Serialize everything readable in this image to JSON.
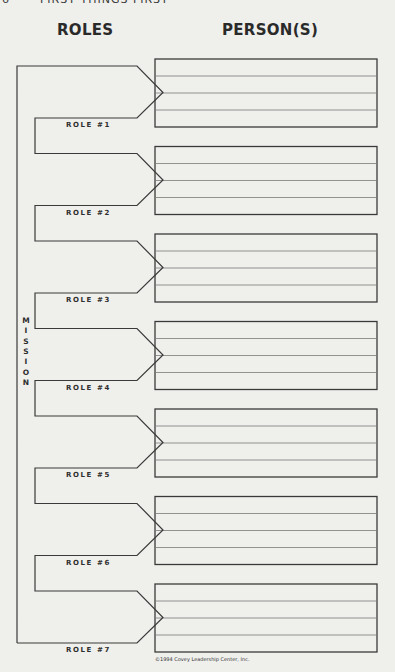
{
  "header": {
    "page_number": "6",
    "book_title": "FIRST THINGS FIRST"
  },
  "headings": {
    "roles": "ROLES",
    "persons": "PERSON(S)"
  },
  "mission": {
    "label": "MISSION",
    "letters": [
      "M",
      "I",
      "S",
      "S",
      "I",
      "O",
      "N"
    ]
  },
  "roles": [
    {
      "label": "ROLE #1",
      "persons": [
        "",
        "",
        "",
        ""
      ]
    },
    {
      "label": "ROLE #2",
      "persons": [
        "",
        "",
        "",
        ""
      ]
    },
    {
      "label": "ROLE #3",
      "persons": [
        "",
        "",
        "",
        ""
      ]
    },
    {
      "label": "ROLE #4",
      "persons": [
        "",
        "",
        "",
        ""
      ]
    },
    {
      "label": "ROLE #5",
      "persons": [
        "",
        "",
        "",
        ""
      ]
    },
    {
      "label": "ROLE #6",
      "persons": [
        "",
        "",
        "",
        ""
      ]
    },
    {
      "label": "ROLE #7",
      "persons": [
        "",
        "",
        "",
        ""
      ]
    }
  ],
  "footer": {
    "copyright": "©1994 Covey Leadership Center, Inc."
  },
  "colors": {
    "background": "#efefec",
    "line": "#3a3a3a",
    "inner_line": "#7a7a7a"
  }
}
